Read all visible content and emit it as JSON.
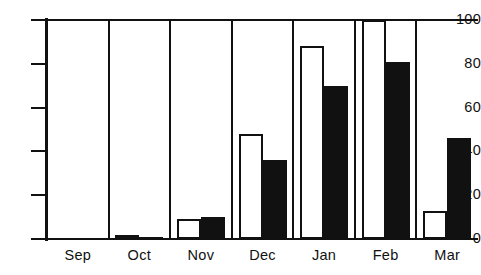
{
  "chart_data": {
    "type": "bar",
    "title": "",
    "subtitle": "",
    "xlabel": "",
    "ylabel": "",
    "categories": [
      "Sep",
      "Oct",
      "Nov",
      "Dec",
      "Jan",
      "Feb",
      "Mar"
    ],
    "series": [
      {
        "name": "open",
        "color": "#ffffff",
        "values": [
          0,
          1,
          9,
          48,
          88,
          100,
          13
        ]
      },
      {
        "name": "filled",
        "color": "#111111",
        "values": [
          0,
          0.5,
          10,
          36,
          70,
          81,
          46
        ]
      }
    ],
    "ylim": [
      0,
      100
    ],
    "yticks": [
      0,
      20,
      40,
      60,
      80,
      100
    ],
    "ytick_labels": [
      "0",
      "20",
      "40",
      "60",
      "80",
      "100"
    ],
    "grid": false,
    "legend": false,
    "legend_position": "none",
    "annotations": []
  }
}
